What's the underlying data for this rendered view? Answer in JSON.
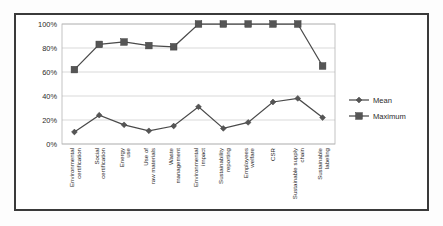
{
  "chart_data": {
    "type": "line",
    "title": "",
    "xlabel": "",
    "ylabel": "",
    "ylim": [
      0,
      100
    ],
    "yticks": [
      "0%",
      "20%",
      "40%",
      "60%",
      "80%",
      "100%"
    ],
    "ytick_values": [
      0,
      20,
      40,
      60,
      80,
      100
    ],
    "grid": true,
    "legend_position": "right",
    "categories": [
      "Environmental certification",
      "Social certification",
      "Energy use",
      "Use of raw materials",
      "Waste management",
      "Environmental impact",
      "Sustainability reporting",
      "Employees welfare",
      "CSR",
      "Sustainable supply chain",
      "Sustainable labeling"
    ],
    "series": [
      {
        "name": "Mean",
        "marker": "diamond",
        "color": "#555555",
        "values": [
          10,
          24,
          16,
          11,
          15,
          31,
          13,
          18,
          35,
          38,
          22
        ]
      },
      {
        "name": "Maximum",
        "marker": "square",
        "color": "#555555",
        "values": [
          62,
          83,
          85,
          82,
          81,
          100,
          100,
          100,
          100,
          100,
          65
        ]
      }
    ]
  },
  "legend": {
    "items": [
      {
        "label": "Mean",
        "marker": "diamond"
      },
      {
        "label": "Maximum",
        "marker": "square"
      }
    ]
  },
  "colors": {
    "frame": "#3a3a3a",
    "grid": "#c9c9c9",
    "line": "#4a4a4a",
    "marker": "#555555",
    "text": "#2b2b2b",
    "background": "#ffffff"
  }
}
